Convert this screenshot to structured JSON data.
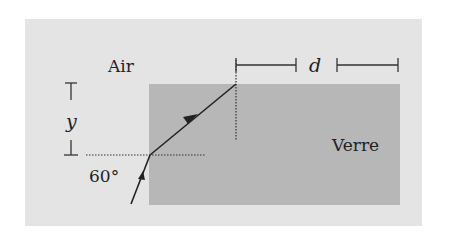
{
  "diagram": {
    "type": "optics-refraction",
    "labels": {
      "medium_top": "Air",
      "medium_glass": "Verre",
      "height_symbol": "y",
      "width_symbol": "d",
      "angle": "60°"
    },
    "colors": {
      "panel": "#e4e4e4",
      "glass": "#b7b7b7",
      "lines": "#222222"
    }
  }
}
